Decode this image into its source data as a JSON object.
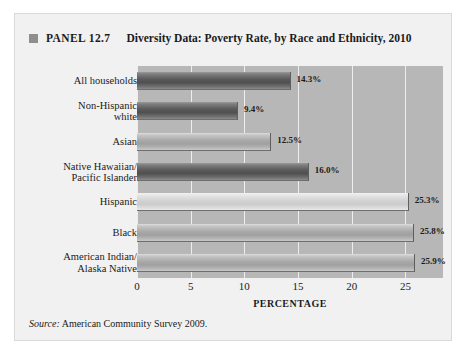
{
  "figure": {
    "panel_marker_icon": "square-bullet-icon",
    "panel_number": "PANEL 12.7",
    "title": "Diversity Data: Poverty Rate, by Race and Ethnicity, 2010",
    "source_word": "Source:",
    "source_text": " American Community Survey 2009.",
    "background_color": "#f1f1f1",
    "plot_background_color": "#b7b7b7",
    "gridline_color": "#eeeeee"
  },
  "chart_data": {
    "type": "bar",
    "orientation": "horizontal",
    "title": "Diversity Data: Poverty Rate, by Race and Ethnicity, 2010",
    "xlabel": "PERCENTAGE",
    "ylabel": "",
    "xlim": [
      0,
      28.5
    ],
    "xticks": [
      0,
      5,
      10,
      15,
      20,
      25
    ],
    "xtick_labels": [
      "0",
      "5",
      "10",
      "15",
      "20",
      "25"
    ],
    "grid": "vertical-only",
    "legend": "none",
    "categories": [
      "All households",
      "Non-Hispanic white",
      "Asian",
      "Native Hawaiian/ Pacific Islander",
      "Hispanic",
      "Black",
      "American Indian/ Alaska Native"
    ],
    "values": [
      14.3,
      9.4,
      12.5,
      16.0,
      25.3,
      25.8,
      25.9
    ],
    "value_labels": [
      "14.3%",
      "9.4%",
      "12.5%",
      "16.0%",
      "25.3%",
      "25.8%",
      "25.9%"
    ],
    "bars": [
      {
        "label_line1": "All households",
        "label_line2": "",
        "value": 14.3,
        "value_label": "14.3%",
        "shade": "dark"
      },
      {
        "label_line1": "Non-Hispanic",
        "label_line2": "white",
        "value": 9.4,
        "value_label": "9.4%",
        "shade": "dark"
      },
      {
        "label_line1": "Asian",
        "label_line2": "",
        "value": 12.5,
        "value_label": "12.5%",
        "shade": "mid"
      },
      {
        "label_line1": "Native Hawaiian/",
        "label_line2": "Pacific Islander",
        "value": 16.0,
        "value_label": "16.0%",
        "shade": "dark"
      },
      {
        "label_line1": "Hispanic",
        "label_line2": "",
        "value": 25.3,
        "value_label": "25.3%",
        "shade": "light"
      },
      {
        "label_line1": "Black",
        "label_line2": "",
        "value": 25.8,
        "value_label": "25.8%",
        "shade": "mid"
      },
      {
        "label_line1": "American Indian/",
        "label_line2": "Alaska Native",
        "value": 25.9,
        "value_label": "25.9%",
        "shade": "mid"
      }
    ]
  }
}
